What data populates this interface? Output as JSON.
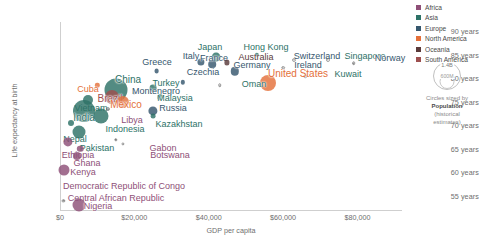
{
  "chart_data": {
    "type": "scatter",
    "title": "",
    "xlabel": "GDP per capita",
    "ylabel": "Life expectancy at birth",
    "xlim": [
      0,
      92000
    ],
    "ylim": [
      52,
      92
    ],
    "xticks": [
      "$0",
      "$20,000",
      "$40,000",
      "$60,000",
      "$80,000"
    ],
    "xtick_values": [
      0,
      20000,
      40000,
      60000,
      80000
    ],
    "yticks": [
      "55 years",
      "60 years",
      "65 years",
      "70 years",
      "75 years",
      "80 years",
      "85 years",
      "90 years"
    ],
    "ytick_values": [
      55,
      60,
      65,
      70,
      75,
      80,
      85,
      90
    ],
    "grid": false,
    "legend_position": "right",
    "size_encoding": "Population (historical estimates)",
    "series": [
      {
        "name": "Africa",
        "color": "#8e4f77"
      },
      {
        "name": "Asia",
        "color": "#2d7267"
      },
      {
        "name": "Europe",
        "color": "#36576e"
      },
      {
        "name": "North America",
        "color": "#e4703a"
      },
      {
        "name": "Oceania",
        "color": "#5a3a3a"
      },
      {
        "name": "South America",
        "color": "#9d4f4f"
      }
    ],
    "points": [
      {
        "label": "Japan",
        "continent": "Asia",
        "x": 42000,
        "y": 84.6,
        "r": 4.4,
        "lx": 210,
        "ly": 47,
        "size": "mid"
      },
      {
        "label": "Italy",
        "continent": "Europe",
        "x": 38000,
        "y": 83.5,
        "r": 3.6,
        "lx": 191,
        "ly": 56,
        "size": "mid"
      },
      {
        "label": "France",
        "continent": "Europe",
        "x": 41000,
        "y": 83.0,
        "r": 3.8,
        "lx": 214,
        "ly": 58,
        "size": "mid"
      },
      {
        "label": "Switzerland",
        "continent": "Europe",
        "x": 63000,
        "y": 84.0,
        "r": 2.0,
        "lx": 317,
        "ly": 56,
        "size": "mid"
      },
      {
        "label": "Singapore",
        "continent": "Asia",
        "x": 72000,
        "y": 84.0,
        "r": 2.0,
        "lx": 365,
        "ly": 56,
        "size": "mid"
      },
      {
        "label": "Hong Kong",
        "continent": "Asia",
        "x": 53000,
        "y": 85.0,
        "r": 2.2,
        "lx": 266,
        "ly": 47,
        "size": "mid"
      },
      {
        "label": "Australia",
        "continent": "Oceania",
        "x": 45000,
        "y": 83.4,
        "r": 2.6,
        "lx": 256,
        "ly": 57,
        "size": "mid"
      },
      {
        "label": "Germany",
        "continent": "Europe",
        "x": 47000,
        "y": 81.5,
        "r": 4.2,
        "lx": 252,
        "ly": 65,
        "size": "mid"
      },
      {
        "label": "Ireland",
        "continent": "Europe",
        "x": 60000,
        "y": 82.3,
        "r": 1.8,
        "lx": 308,
        "ly": 65,
        "size": "mid"
      },
      {
        "label": "Norway",
        "continent": "Europe",
        "x": 79000,
        "y": 83.2,
        "r": 1.8,
        "lx": 390,
        "ly": 58,
        "size": "mid"
      },
      {
        "label": "Kuwait",
        "continent": "Asia",
        "x": 66000,
        "y": 80.5,
        "r": 1.8,
        "lx": 348,
        "ly": 74,
        "size": "mid"
      },
      {
        "label": "United States",
        "continent": "North America",
        "x": 56000,
        "y": 79.0,
        "r": 8.0,
        "lx": 298,
        "ly": 74,
        "size": "big"
      },
      {
        "label": "Oman",
        "continent": "Asia",
        "x": 43000,
        "y": 78.5,
        "r": 1.8,
        "lx": 254,
        "ly": 84,
        "size": "mid"
      },
      {
        "label": "Czechia",
        "continent": "Europe",
        "x": 33000,
        "y": 79.2,
        "r": 2.2,
        "lx": 203,
        "ly": 72,
        "size": "mid"
      },
      {
        "label": "Greece",
        "continent": "Europe",
        "x": 26000,
        "y": 81.5,
        "r": 2.4,
        "lx": 157,
        "ly": 62,
        "size": "mid"
      },
      {
        "label": "Turkey",
        "continent": "Asia",
        "x": 25000,
        "y": 78.0,
        "r": 3.4,
        "lx": 166,
        "ly": 83,
        "size": "mid"
      },
      {
        "label": "Montenegro",
        "continent": "Europe",
        "x": 20000,
        "y": 77.0,
        "r": 1.5,
        "lx": 156,
        "ly": 91,
        "size": "mid"
      },
      {
        "label": "Malaysia",
        "continent": "Asia",
        "x": 27000,
        "y": 76.0,
        "r": 2.8,
        "lx": 175,
        "ly": 98,
        "size": "mid"
      },
      {
        "label": "Russia",
        "continent": "Europe",
        "x": 25000,
        "y": 73.0,
        "r": 4.6,
        "lx": 173,
        "ly": 108,
        "size": "mid"
      },
      {
        "label": "Kazakhstan",
        "continent": "Asia",
        "x": 25000,
        "y": 72.0,
        "r": 2.4,
        "lx": 179,
        "ly": 124,
        "size": "mid"
      },
      {
        "label": "China",
        "continent": "Asia",
        "x": 15000,
        "y": 77.5,
        "r": 11.5,
        "lx": 128,
        "ly": 80,
        "size": "big"
      },
      {
        "label": "Brazil",
        "continent": "South America",
        "x": 14000,
        "y": 76.0,
        "r": 7.0,
        "lx": 110,
        "ly": 99,
        "size": "big"
      },
      {
        "label": "Mexico",
        "continent": "North America",
        "x": 17000,
        "y": 75.0,
        "r": 6.0,
        "lx": 126,
        "ly": 105,
        "size": "big"
      },
      {
        "label": "Cuba",
        "continent": "North America",
        "x": 10000,
        "y": 78.5,
        "r": 2.2,
        "lx": 88,
        "ly": 89,
        "size": "mid"
      },
      {
        "label": "Vietnam",
        "continent": "Asia",
        "x": 7500,
        "y": 75.4,
        "r": 5.0,
        "lx": 91,
        "ly": 108,
        "size": "mid"
      },
      {
        "label": "India",
        "continent": "Asia",
        "x": 6500,
        "y": 73.0,
        "r": 11.0,
        "lx": 84,
        "ly": 118,
        "size": "big"
      },
      {
        "label": "Libya",
        "continent": "Africa",
        "x": 13000,
        "y": 73.5,
        "r": 2.0,
        "lx": 132,
        "ly": 120,
        "size": "mid"
      },
      {
        "label": "Indonesia",
        "continent": "Asia",
        "x": 11000,
        "y": 72.0,
        "r": 7.5,
        "lx": 125,
        "ly": 129,
        "size": "mid"
      },
      {
        "label": "Nepal",
        "continent": "Asia",
        "x": 3000,
        "y": 70.5,
        "r": 3.0,
        "lx": 75,
        "ly": 139,
        "size": "mid"
      },
      {
        "label": "Pakistan",
        "continent": "Asia",
        "x": 5000,
        "y": 68.5,
        "r": 6.5,
        "lx": 97,
        "ly": 148,
        "size": "mid"
      },
      {
        "label": "Gabon",
        "continent": "Africa",
        "x": 15000,
        "y": 67.0,
        "r": 1.6,
        "lx": 163,
        "ly": 148,
        "size": "mid"
      },
      {
        "label": "Botswana",
        "continent": "Africa",
        "x": 17000,
        "y": 66.0,
        "r": 1.6,
        "lx": 170,
        "ly": 155,
        "size": "mid"
      },
      {
        "label": "Ethiopia",
        "continent": "Africa",
        "x": 2200,
        "y": 66.5,
        "r": 4.6,
        "lx": 78,
        "ly": 155,
        "size": "mid"
      },
      {
        "label": "Ghana",
        "continent": "Africa",
        "x": 5500,
        "y": 65.0,
        "r": 3.2,
        "lx": 87,
        "ly": 163,
        "size": "mid"
      },
      {
        "label": "Kenya",
        "continent": "Africa",
        "x": 4500,
        "y": 63.5,
        "r": 4.0,
        "lx": 83,
        "ly": 172,
        "size": "mid"
      },
      {
        "label": "Democratic Republic of Congo",
        "continent": "Africa",
        "x": 1100,
        "y": 60.5,
        "r": 5.5,
        "lx": 124,
        "ly": 186,
        "size": "mid"
      },
      {
        "label": "Central African Republic",
        "continent": "Africa",
        "x": 900,
        "y": 54.0,
        "r": 1.6,
        "lx": 116,
        "ly": 198,
        "size": "mid"
      },
      {
        "label": "Nigeria",
        "continent": "Africa",
        "x": 5200,
        "y": 53.0,
        "r": 6.5,
        "lx": 98,
        "ly": 206,
        "size": "mid"
      }
    ]
  },
  "legend": {
    "entries": [
      {
        "label": "Africa",
        "color": "#8e4f77"
      },
      {
        "label": "Asia",
        "color": "#2d7267"
      },
      {
        "label": "Europe",
        "color": "#36576e"
      },
      {
        "label": "North America",
        "color": "#e4703a"
      },
      {
        "label": "Oceania",
        "color": "#5a3a3a"
      },
      {
        "label": "South America",
        "color": "#9d4f4f"
      }
    ]
  },
  "size_legend": {
    "large_label": "1.4B",
    "small_label": "600M",
    "caption_line1": "Circles sized by",
    "caption_line2": "Population",
    "caption_line3": "(historical",
    "caption_line4": "estimates)"
  },
  "footer": {
    "note": ""
  }
}
